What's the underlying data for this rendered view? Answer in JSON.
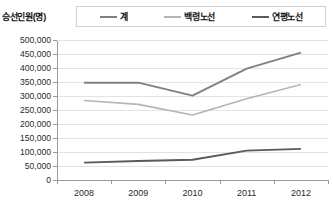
{
  "y_axis_title": "승선인원(명)",
  "legend": {
    "items": [
      {
        "label": "계",
        "color": "#808080"
      },
      {
        "label": "백령노선",
        "color": "#b5b5b5"
      },
      {
        "label": "연평노선",
        "color": "#5a5a5a"
      }
    ]
  },
  "axis": {
    "y_ticks": [
      "0",
      "50,000",
      "100,000",
      "150,000",
      "200,000",
      "250,000",
      "300,000",
      "350,000",
      "400,000",
      "450,000",
      "500,000"
    ],
    "x_ticks": [
      "2008",
      "2009",
      "2010",
      "2011",
      "2012"
    ]
  },
  "chart_data": {
    "type": "line",
    "title": "",
    "xlabel": "",
    "ylabel": "승선인원(명)",
    "categories": [
      "2008",
      "2009",
      "2010",
      "2011",
      "2012"
    ],
    "ylim": [
      0,
      500000
    ],
    "ytick_step": 50000,
    "grid": true,
    "legend_position": "top",
    "series": [
      {
        "name": "계",
        "color": "#808080",
        "values": [
          347000,
          348000,
          301000,
          398000,
          455000
        ]
      },
      {
        "name": "백령노선",
        "color": "#b5b5b5",
        "values": [
          284000,
          270000,
          232000,
          290000,
          341000
        ]
      },
      {
        "name": "연평노선",
        "color": "#5a5a5a",
        "values": [
          62000,
          68000,
          72000,
          105000,
          111000
        ]
      }
    ]
  }
}
